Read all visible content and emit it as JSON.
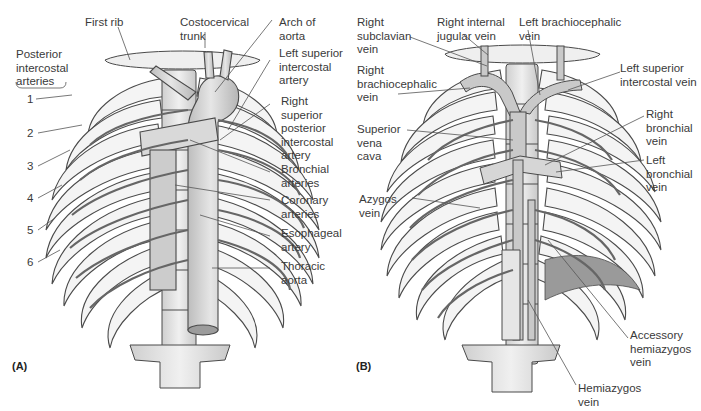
{
  "figure": {
    "panels": [
      {
        "id": "A",
        "letter": "(A)",
        "subject": "arteries of thoracic wall",
        "labels": {
          "first_rib": "First rib",
          "costocervical_trunk": "Costocervical\ntrunk",
          "arch_of_aorta": "Arch of\naorta",
          "posterior_intercostal_arteries": "Posterior\nintercostal\narteries",
          "left_superior_intercostal_artery": "Left superior\nintercostal\nartery",
          "right_superior_posterior_intercostal_artery": "Right\nsuperior\nposterior\nintercostal\nartery",
          "bronchial_arteries": "Bronchial\narteries",
          "coronary_arteries": "Coronary\narteries",
          "esophageal_artery": "Esophageal\nartery",
          "thoracic_aorta": "Thoracic\naorta"
        },
        "rib_numbers": [
          "1",
          "2",
          "3",
          "4",
          "5",
          "6"
        ]
      },
      {
        "id": "B",
        "letter": "(B)",
        "subject": "veins of thoracic wall",
        "labels": {
          "right_subclavian_vein": "Right\nsubclavian\nvein",
          "right_internal_jugular_vein": "Right internal\njugular vein",
          "left_brachiocephalic_vein": "Left brachiocephalic\nvein",
          "right_brachiocephalic_vein": "Right\nbrachiocephalic\nvein",
          "left_superior_intercostal_vein": "Left superior\nintercostal vein",
          "superior_vena_cava": "Superior\nvena\ncava",
          "right_bronchial_vein": "Right\nbronchial\nvein",
          "left_bronchial_vein": "Left\nbronchial\nvein",
          "azygos_vein": "Azygos\nvein",
          "accessory_hemiazygos_vein": "Accessory\nhemiazygos\nvein",
          "hemiazygos_vein": "Hemiazygos\nvein"
        }
      }
    ]
  },
  "colors": {
    "outline": "#4a4a4a",
    "bone": "#f2f2f2",
    "vessel": "#c8c8c8",
    "shade": "#b0b0b0",
    "leader": "#555555",
    "text": "#3a3a3a"
  }
}
